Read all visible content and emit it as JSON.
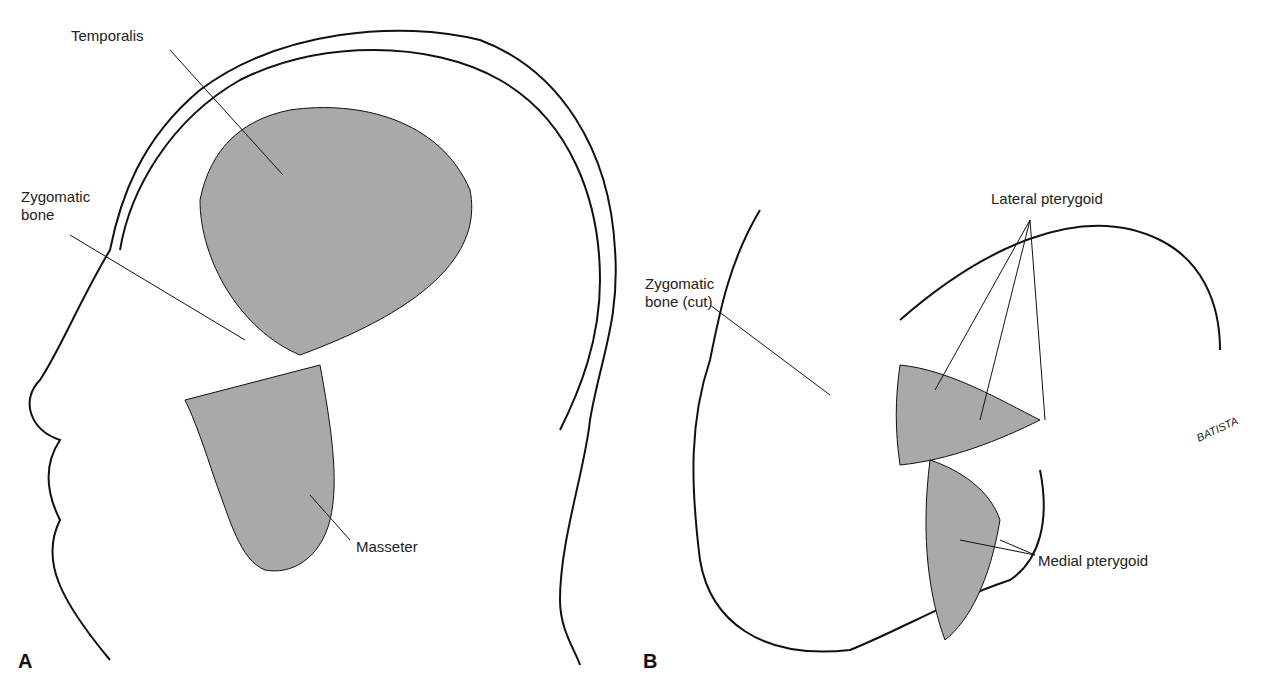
{
  "panels": [
    {
      "letter": "A",
      "view": "lateral head, superficial",
      "labels": {
        "temporalis": "Temporalis",
        "zygomatic": "Zygomatic\nbone",
        "masseter": "Masseter"
      }
    },
    {
      "letter": "B",
      "view": "lateral skull, deep (zygomatic cut)",
      "labels": {
        "zygomatic_cut": "Zygomatic\nbone (cut)",
        "lateral_pterygoid": "Lateral pterygoid",
        "medial_pterygoid": "Medial pterygoid"
      },
      "signature": "BATISTA"
    }
  ],
  "colors": {
    "muscle_fill": "#a9a9a9",
    "line": "#111111",
    "background": "#ffffff"
  }
}
